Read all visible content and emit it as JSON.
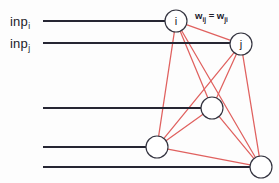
{
  "figure": {
    "type": "neural-network-diagram",
    "width": 279,
    "height": 183,
    "background_color": "#fdfdfd",
    "edge_color": "#e0615f",
    "input_line_color": "#262633",
    "node_stroke_color": "#33333f",
    "node_fill_color": "#ffffff",
    "text_color": "#1b1b28"
  },
  "inputs": [
    {
      "id": "inp-i",
      "base": "inp",
      "sub": "i",
      "label_x": 10,
      "label_y": 14,
      "line_y": 21,
      "line_x1": 43,
      "line_x2": 176
    },
    {
      "id": "inp-j",
      "base": "inp",
      "sub": "j",
      "label_x": 10,
      "label_y": 36,
      "line_y": 43,
      "line_x1": 43,
      "line_x2": 241
    },
    {
      "id": "inp-3",
      "base": "",
      "sub": "",
      "label_x": 0,
      "label_y": 0,
      "line_y": 108,
      "line_x1": 43,
      "line_x2": 212
    },
    {
      "id": "inp-4",
      "base": "",
      "sub": "",
      "label_x": 0,
      "label_y": 0,
      "line_y": 147,
      "line_x1": 43,
      "line_x2": 157
    },
    {
      "id": "inp-5",
      "base": "",
      "sub": "",
      "label_x": 0,
      "label_y": 0,
      "line_y": 167,
      "line_x1": 43,
      "line_x2": 261
    }
  ],
  "nodes": [
    {
      "id": "node-i",
      "label": "i",
      "cx": 176,
      "cy": 21,
      "r": 11
    },
    {
      "id": "node-j",
      "label": "j",
      "cx": 241,
      "cy": 44,
      "r": 11
    },
    {
      "id": "node-3",
      "label": "",
      "cx": 212,
      "cy": 108,
      "r": 11
    },
    {
      "id": "node-4",
      "label": "",
      "cx": 157,
      "cy": 147,
      "r": 11
    },
    {
      "id": "node-5",
      "label": "",
      "cx": 261,
      "cy": 167,
      "r": 11
    }
  ],
  "edges": [
    {
      "from": "node-i",
      "to": "node-j"
    },
    {
      "from": "node-i",
      "to": "node-3"
    },
    {
      "from": "node-i",
      "to": "node-4"
    },
    {
      "from": "node-i",
      "to": "node-5"
    },
    {
      "from": "node-j",
      "to": "node-3"
    },
    {
      "from": "node-j",
      "to": "node-4"
    },
    {
      "from": "node-j",
      "to": "node-5"
    },
    {
      "from": "node-3",
      "to": "node-4"
    },
    {
      "from": "node-3",
      "to": "node-5"
    },
    {
      "from": "node-4",
      "to": "node-5"
    }
  ],
  "annotations": {
    "weight": {
      "id": "weight-equality",
      "text_parts": [
        "w",
        "ij",
        " = w",
        "ji"
      ],
      "plain": "w_ij = w_ji",
      "x": 195,
      "y": 10
    }
  }
}
